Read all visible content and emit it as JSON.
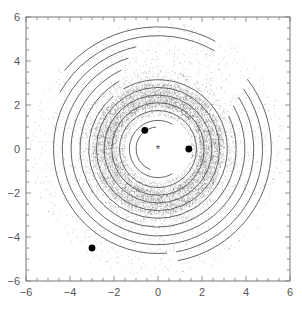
{
  "chart_data": {
    "type": "scatter",
    "title": "",
    "xlabel": "",
    "ylabel": "",
    "xlim": [
      -6,
      6
    ],
    "ylim": [
      -6,
      6
    ],
    "grid": false,
    "legend": null,
    "x_ticks": [
      -6,
      -4,
      -2,
      0,
      2,
      4,
      6
    ],
    "y_ticks": [
      -6,
      -4,
      -2,
      0,
      2,
      4,
      6
    ],
    "x_tick_labels": [
      "−6",
      "−4",
      "−2",
      "0",
      "2",
      "4",
      "6"
    ],
    "y_tick_labels": [
      "−6",
      "−4",
      "−2",
      "0",
      "2",
      "4",
      "6"
    ],
    "center_marker": {
      "x": 0,
      "y": 0,
      "symbol": "asterisk"
    },
    "bodies": [
      {
        "x": -0.6,
        "y": 0.85,
        "symbol": "filled-circle"
      },
      {
        "x": 1.4,
        "y": 0.0,
        "symbol": "filled-circle"
      },
      {
        "x": -3.0,
        "y": -4.5,
        "symbol": "filled-circle"
      }
    ],
    "rings": [
      {
        "r": 1.0,
        "start_deg": 95,
        "end_deg": 250
      },
      {
        "r": 1.3,
        "start_deg": 60,
        "end_deg": 300
      },
      {
        "r": 1.75,
        "start_deg": 0,
        "end_deg": 360
      },
      {
        "r": 2.1,
        "start_deg": 0,
        "end_deg": 360
      },
      {
        "r": 2.45,
        "start_deg": 0,
        "end_deg": 360
      },
      {
        "r": 2.8,
        "start_deg": 0,
        "end_deg": 360
      },
      {
        "r": 3.15,
        "start_deg": -60,
        "end_deg": 120
      },
      {
        "r": 3.15,
        "start_deg": 130,
        "end_deg": 300
      },
      {
        "r": 3.55,
        "start_deg": -70,
        "end_deg": 25
      },
      {
        "r": 3.55,
        "start_deg": 120,
        "end_deg": 290
      },
      {
        "r": 3.95,
        "start_deg": -75,
        "end_deg": 30
      },
      {
        "r": 3.95,
        "start_deg": 115,
        "end_deg": 285
      },
      {
        "r": 4.35,
        "start_deg": -80,
        "end_deg": 33
      },
      {
        "r": 4.35,
        "start_deg": 108,
        "end_deg": 280
      },
      {
        "r": 4.75,
        "start_deg": -80,
        "end_deg": 35
      },
      {
        "r": 4.75,
        "start_deg": 102,
        "end_deg": 275
      },
      {
        "r": 5.15,
        "start_deg": -80,
        "end_deg": 38
      },
      {
        "r": 5.15,
        "start_deg": 60,
        "end_deg": 150
      },
      {
        "r": 5.55,
        "start_deg": 62,
        "end_deg": 140
      }
    ],
    "particle_disk": {
      "inner_r": 1.5,
      "outer_r": 3.6,
      "dense_inner_r": 1.9,
      "dense_outer_r": 3.0,
      "color": "#333333"
    },
    "colors": {
      "axes": "#777777",
      "rings": "#555555",
      "markers": "#000000",
      "particles": "#444444"
    }
  }
}
